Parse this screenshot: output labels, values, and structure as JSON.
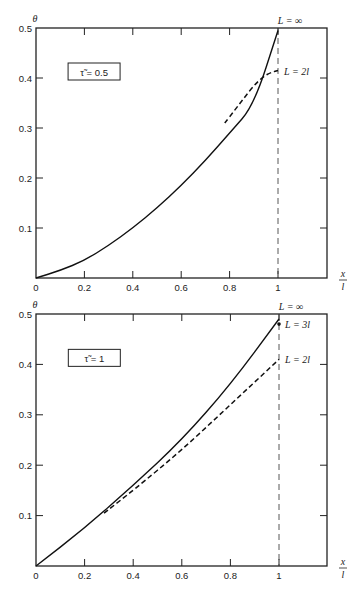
{
  "chart_data": [
    {
      "type": "line",
      "title": "",
      "ylabel": "θ",
      "xlabel": "x/l",
      "xlim": [
        0,
        1.2
      ],
      "ylim": [
        0,
        0.5
      ],
      "xticks": [
        0,
        0.2,
        0.4,
        0.6,
        0.8,
        1
      ],
      "xtick_labels": [
        "0",
        "0.2",
        "0.4",
        "0.6",
        "0.8",
        "1"
      ],
      "yticks": [
        0.1,
        0.2,
        0.3,
        0.4,
        0.5
      ],
      "ytick_labels": [
        "0.1",
        "0.2",
        "0.3",
        "0.4",
        "0.5"
      ],
      "parameter_label": "τ̃ = 0.5",
      "reference_line": {
        "x": 1,
        "style": "dashed"
      },
      "series": [
        {
          "name": "L = ∞",
          "style": "solid",
          "x": [
            0,
            0.1,
            0.2,
            0.3,
            0.4,
            0.5,
            0.6,
            0.7,
            0.8,
            0.9,
            1.0
          ],
          "y": [
            0,
            0.015,
            0.035,
            0.065,
            0.1,
            0.14,
            0.185,
            0.235,
            0.29,
            0.345,
            0.495
          ]
        },
        {
          "name": "L = 2l",
          "style": "dashed",
          "x": [
            0.78,
            0.82,
            0.86,
            0.9,
            0.94,
            0.97,
            1.0
          ],
          "y": [
            0.31,
            0.335,
            0.36,
            0.385,
            0.403,
            0.411,
            0.415
          ]
        }
      ],
      "annotations": [
        "L = ∞",
        "L = 2l"
      ]
    },
    {
      "type": "line",
      "title": "",
      "ylabel": "θ",
      "xlabel": "x/l",
      "xlim": [
        0,
        1.2
      ],
      "ylim": [
        0,
        0.5
      ],
      "xticks": [
        0,
        0.2,
        0.4,
        0.6,
        0.8,
        1
      ],
      "xtick_labels": [
        "0",
        "0.2",
        "0.4",
        "0.6",
        "0.8",
        "1"
      ],
      "yticks": [
        0.1,
        0.2,
        0.3,
        0.4,
        0.5
      ],
      "ytick_labels": [
        "0.1",
        "0.2",
        "0.3",
        "0.4",
        "0.5"
      ],
      "parameter_label": "τ̃ = 1",
      "reference_line": {
        "x": 1,
        "style": "dashed"
      },
      "series": [
        {
          "name": "L = ∞",
          "style": "solid",
          "x": [
            0,
            0.2,
            0.4,
            0.6,
            0.8,
            1.0
          ],
          "y": [
            0,
            0.075,
            0.16,
            0.25,
            0.36,
            0.49
          ]
        },
        {
          "name": "L = 2l",
          "style": "dashed",
          "x": [
            0.28,
            0.4,
            0.6,
            0.8,
            1.0
          ],
          "y": [
            0.105,
            0.15,
            0.23,
            0.32,
            0.41
          ]
        },
        {
          "name": "L = 3l",
          "style": "point",
          "x": [
            1.0
          ],
          "y": [
            0.48
          ]
        }
      ],
      "annotations": [
        "L = ∞",
        "L = 3l",
        "L = 2l"
      ]
    }
  ]
}
